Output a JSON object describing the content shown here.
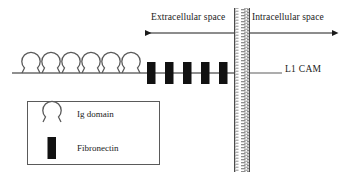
{
  "figure": {
    "title_alt": "L1 CAM structure at the cell membrane",
    "background_color": "#ffffff",
    "ink_color": "#1a1a1a",
    "loop_stroke_color": "#555555",
    "block_fill_color": "#111111"
  },
  "labels": {
    "extracellular": "Extracellular space",
    "intracellular": "Intracellular space",
    "molecule": "L1 CAM"
  },
  "legend": {
    "items": [
      {
        "symbol": "ig-domain-loop",
        "label": "Ig domain"
      },
      {
        "symbol": "fibronectin-block",
        "label": "Fibronectin"
      }
    ]
  },
  "diagram": {
    "ig_domain_count": 6,
    "fibronectin_count": 5,
    "membrane": {
      "x_left": 234,
      "x_right": 250,
      "y_top": 8,
      "y_bottom": 172
    },
    "arrows": {
      "extracellular": {
        "x_from": 234,
        "x_to": 143,
        "direction": "left"
      },
      "intracellular": {
        "x_from": 250,
        "x_to": 334,
        "direction": "right"
      },
      "y": 33
    },
    "backbone_y": 73
  }
}
